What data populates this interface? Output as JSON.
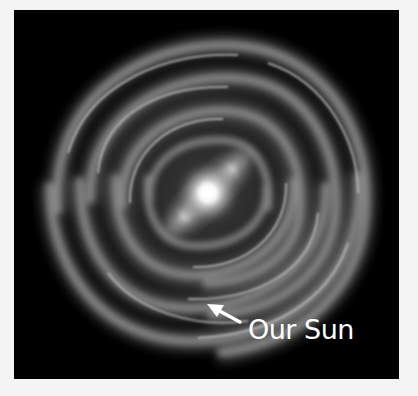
{
  "figure": {
    "annotation": {
      "label": "Our Sun",
      "icon": "arrow-pointer-icon"
    },
    "colors": {
      "page_background": "#f4f4f4",
      "panel_background": "#000000",
      "label_color": "#ffffff",
      "core_color": "#ffffff",
      "arm_color": "#8a8a8a"
    }
  }
}
